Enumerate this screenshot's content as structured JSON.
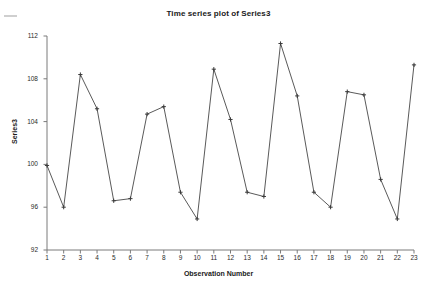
{
  "chart_data": {
    "type": "line",
    "title": "Time series plot of Series3",
    "xlabel": "Observation Number",
    "ylabel": "Series3",
    "grid": false,
    "legend": "none",
    "marker": "plus",
    "line_color": "#5a5a5a",
    "marker_color": "#3a3a3a",
    "axis_color": "#7a7a7a",
    "xlim": [
      1,
      23
    ],
    "ylim": [
      92,
      112
    ],
    "yticks": [
      92,
      96,
      100,
      104,
      108,
      112
    ],
    "xticks": [
      1,
      2,
      3,
      4,
      5,
      6,
      7,
      8,
      9,
      10,
      11,
      12,
      13,
      14,
      15,
      16,
      17,
      18,
      19,
      20,
      21,
      22,
      23
    ],
    "categories": [
      1,
      2,
      3,
      4,
      5,
      6,
      7,
      8,
      9,
      10,
      11,
      12,
      13,
      14,
      15,
      16,
      17,
      18,
      19,
      20,
      21,
      22,
      23
    ],
    "values": [
      99.9,
      96.0,
      108.4,
      105.2,
      96.6,
      96.8,
      104.7,
      105.4,
      97.4,
      94.9,
      108.9,
      104.2,
      97.4,
      97.0,
      111.3,
      106.4,
      97.4,
      96.0,
      106.8,
      106.5,
      98.6,
      94.9,
      109.3
    ],
    "series": [
      {
        "name": "Series3",
        "values": [
          99.9,
          96.0,
          108.4,
          105.2,
          96.6,
          96.8,
          104.7,
          105.4,
          97.4,
          94.9,
          108.9,
          104.2,
          97.4,
          97.0,
          111.3,
          106.4,
          97.4,
          96.0,
          106.8,
          106.5,
          98.6,
          94.9,
          109.3
        ]
      }
    ]
  },
  "plot_geometry": {
    "left": 47,
    "right": 414,
    "top": 36,
    "bottom": 250
  }
}
